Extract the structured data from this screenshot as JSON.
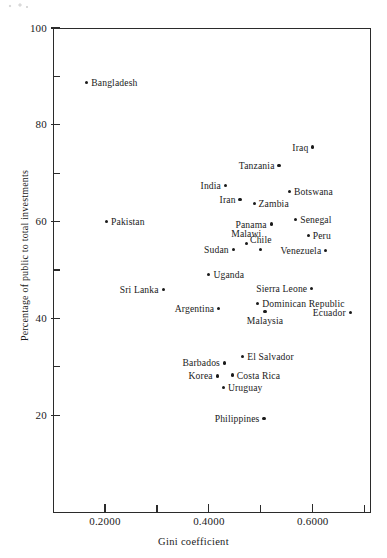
{
  "chart_data": {
    "type": "scatter",
    "title": "",
    "xlabel": "Gini coefficient",
    "ylabel": "Percentage of public to total investments",
    "xlim": [
      0.1,
      0.71
    ],
    "ylim": [
      0,
      100
    ],
    "grid": false,
    "legend": null,
    "x_ticks_major": [
      "0.2000",
      "0.4000",
      "0.6000"
    ],
    "x_ticks_major_values": [
      0.2,
      0.4,
      0.6
    ],
    "x_ticks_minor_values": [
      0.3,
      0.5,
      0.7
    ],
    "y_ticks_major": [
      "100",
      "80",
      "60",
      "40",
      "20"
    ],
    "y_ticks_major_values": [
      100,
      80,
      60,
      40,
      20
    ],
    "y_ticks_minor_values": [
      90,
      70,
      50,
      30
    ],
    "points": [
      {
        "label": "Bangladesh",
        "x": 0.165,
        "y": 88.7,
        "anchor": "right"
      },
      {
        "label": "Iraq",
        "x": 0.6,
        "y": 75.4,
        "anchor": "left"
      },
      {
        "label": "Tanzania",
        "x": 0.535,
        "y": 71.6,
        "anchor": "left"
      },
      {
        "label": "India",
        "x": 0.432,
        "y": 67.5,
        "anchor": "left"
      },
      {
        "label": "Botswana",
        "x": 0.555,
        "y": 66.2,
        "anchor": "right"
      },
      {
        "label": "Iran",
        "x": 0.46,
        "y": 64.6,
        "anchor": "left"
      },
      {
        "label": "Zambia",
        "x": 0.487,
        "y": 63.8,
        "anchor": "right"
      },
      {
        "label": "Senegal",
        "x": 0.567,
        "y": 60.5,
        "anchor": "right"
      },
      {
        "label": "Panama",
        "x": 0.52,
        "y": 59.5,
        "anchor": "left"
      },
      {
        "label": "Pakistan",
        "x": 0.203,
        "y": 60.1,
        "anchor": "right"
      },
      {
        "label": "Peru",
        "x": 0.591,
        "y": 57.1,
        "anchor": "right"
      },
      {
        "label": "Malawi",
        "x": 0.472,
        "y": 55.5,
        "anchor": "above"
      },
      {
        "label": "Chile",
        "x": 0.5,
        "y": 54.3,
        "anchor": "above"
      },
      {
        "label": "Sudan",
        "x": 0.447,
        "y": 54.3,
        "anchor": "left"
      },
      {
        "label": "Venezuela",
        "x": 0.625,
        "y": 54.1,
        "anchor": "left"
      },
      {
        "label": "Uganda",
        "x": 0.4,
        "y": 49.1,
        "anchor": "right"
      },
      {
        "label": "Sierra Leone",
        "x": 0.598,
        "y": 46.2,
        "anchor": "left"
      },
      {
        "label": "Sri Lanka",
        "x": 0.312,
        "y": 46.0,
        "anchor": "left"
      },
      {
        "label": "Dominican Republic",
        "x": 0.494,
        "y": 43.0,
        "anchor": "right"
      },
      {
        "label": "Argentina",
        "x": 0.419,
        "y": 42.1,
        "anchor": "left"
      },
      {
        "label": "Ecuador",
        "x": 0.672,
        "y": 41.2,
        "anchor": "left"
      },
      {
        "label": "Malaysia",
        "x": 0.508,
        "y": 41.4,
        "anchor": "below"
      },
      {
        "label": "El Salvador",
        "x": 0.465,
        "y": 32.2,
        "anchor": "right"
      },
      {
        "label": "Barbados",
        "x": 0.43,
        "y": 30.8,
        "anchor": "left"
      },
      {
        "label": "Costa Rica",
        "x": 0.445,
        "y": 28.3,
        "anchor": "right"
      },
      {
        "label": "Korea",
        "x": 0.416,
        "y": 28.1,
        "anchor": "left"
      },
      {
        "label": "Uruguay",
        "x": 0.428,
        "y": 25.8,
        "anchor": "right"
      },
      {
        "label": "Philippines",
        "x": 0.506,
        "y": 19.4,
        "anchor": "left"
      }
    ]
  }
}
